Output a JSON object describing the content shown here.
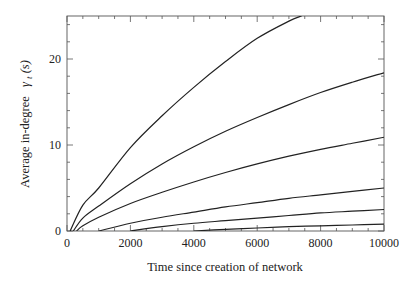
{
  "chart_data": {
    "type": "line",
    "title": "",
    "xlabel": "Time since creation of network",
    "ylabel": "Average in-degree  γt(s)",
    "ylabel_main": "Average in-degree",
    "ylabel_symbol": "γ",
    "ylabel_subscript": "t",
    "ylabel_arg": "(s)",
    "xlim": [
      0,
      10000
    ],
    "ylim": [
      0,
      25
    ],
    "xticks": [
      0,
      2000,
      4000,
      6000,
      8000,
      10000
    ],
    "xtick_labels": [
      "0",
      "2000",
      "4000",
      "6000",
      "8000",
      "10000"
    ],
    "yticks": [
      0,
      10,
      20
    ],
    "ytick_labels": [
      "0",
      "10",
      "20"
    ],
    "x_minor_step": 500,
    "y_minor_step": 2,
    "grid": false,
    "legend": null,
    "series": [
      {
        "name": "curve-1",
        "x": [
          100,
          500,
          1000,
          2000,
          3000,
          4000,
          5000,
          6000,
          7000,
          7400
        ],
        "values": [
          0,
          3.0,
          5.0,
          9.7,
          13.4,
          16.7,
          19.7,
          22.4,
          24.4,
          25.0
        ]
      },
      {
        "name": "curve-2",
        "x": [
          200,
          500,
          1000,
          2000,
          3000,
          4000,
          5000,
          6000,
          7000,
          8000,
          9000,
          10000
        ],
        "values": [
          0,
          1.5,
          2.9,
          5.5,
          7.8,
          9.8,
          11.6,
          13.2,
          14.7,
          16.1,
          17.3,
          18.4
        ]
      },
      {
        "name": "curve-3",
        "x": [
          300,
          500,
          1000,
          2000,
          3000,
          4000,
          5000,
          6000,
          7000,
          8000,
          9000,
          10000
        ],
        "values": [
          0,
          0.6,
          1.6,
          3.2,
          4.5,
          5.7,
          6.8,
          7.8,
          8.7,
          9.5,
          10.2,
          10.9
        ]
      },
      {
        "name": "curve-4",
        "x": [
          1000,
          2000,
          3000,
          4000,
          5000,
          6000,
          7000,
          8000,
          9000,
          10000
        ],
        "values": [
          0,
          0.9,
          1.6,
          2.2,
          2.8,
          3.3,
          3.8,
          4.2,
          4.6,
          5.0
        ]
      },
      {
        "name": "curve-5",
        "x": [
          2000,
          3000,
          4000,
          5000,
          6000,
          7000,
          8000,
          9000,
          10000
        ],
        "values": [
          0,
          0.5,
          0.9,
          1.2,
          1.5,
          1.8,
          2.1,
          2.3,
          2.5
        ]
      },
      {
        "name": "curve-6",
        "x": [
          4000,
          5000,
          6000,
          7000,
          8000,
          9000,
          10000
        ],
        "values": [
          0,
          0.2,
          0.35,
          0.5,
          0.6,
          0.7,
          0.8
        ]
      }
    ],
    "line_color": "#222222"
  }
}
